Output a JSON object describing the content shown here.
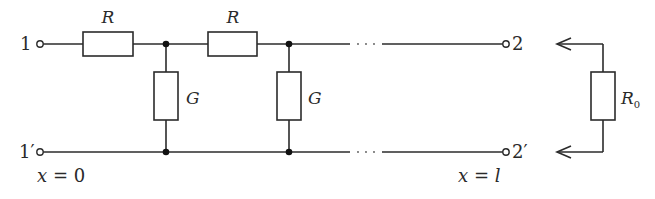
{
  "diagram": {
    "type": "circuit-ladder-network",
    "terminals": {
      "in_top": "1",
      "in_bottom": "1′",
      "out_top": "2",
      "out_bottom": "2′"
    },
    "series_elements": [
      {
        "label": "R"
      },
      {
        "label": "R"
      }
    ],
    "shunt_elements": [
      {
        "label": "G"
      },
      {
        "label": "G"
      }
    ],
    "load": {
      "label": "R",
      "subscript": "0"
    },
    "position_labels": {
      "start": "x = 0",
      "end": "x = l"
    },
    "continuation": "···",
    "colors": {
      "line": "#2b2b2b",
      "background": "#ffffff"
    }
  }
}
